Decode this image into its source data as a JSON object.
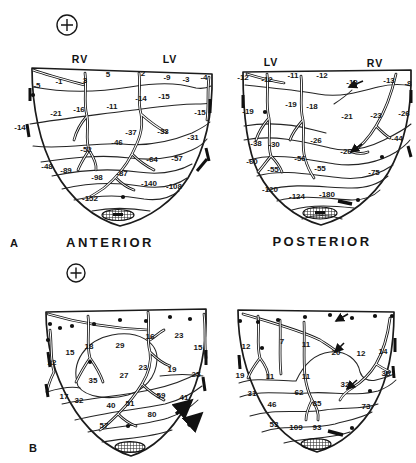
{
  "figure": {
    "panel_a_letter": "A",
    "panel_b_letter": "B",
    "anterior_title": "ANTERIOR",
    "posterior_title": "POSTERIOR",
    "orientation_symbol": "+",
    "ink_color": "#1b1b1b",
    "background_color": "#ffffff"
  },
  "maps": [
    {
      "id": "a-anterior",
      "region_labels": [
        {
          "t": "RV",
          "x": 80,
          "y": 63
        },
        {
          "t": "LV",
          "x": 170,
          "y": 63
        }
      ],
      "values": [
        {
          "t": "5",
          "x": 108,
          "y": 77
        },
        {
          "t": "2",
          "x": 143,
          "y": 76
        },
        {
          "t": "-9",
          "x": 167,
          "y": 80
        },
        {
          "t": "-3",
          "x": 186,
          "y": 82
        },
        {
          "t": "-4",
          "x": 204,
          "y": 80
        },
        {
          "t": "-1",
          "x": 59,
          "y": 84
        },
        {
          "t": "3",
          "x": 85,
          "y": 83
        },
        {
          "t": "-5",
          "x": 37,
          "y": 88
        },
        {
          "t": "-21",
          "x": 56,
          "y": 116
        },
        {
          "t": "-16",
          "x": 79,
          "y": 112
        },
        {
          "t": "-11",
          "x": 112,
          "y": 109
        },
        {
          "t": "-14",
          "x": 141,
          "y": 101
        },
        {
          "t": "-15",
          "x": 164,
          "y": 99
        },
        {
          "t": "-15",
          "x": 200,
          "y": 115
        },
        {
          "t": "-14",
          "x": 20,
          "y": 130
        },
        {
          "t": "-37",
          "x": 131,
          "y": 135
        },
        {
          "t": "-33",
          "x": 163,
          "y": 134
        },
        {
          "t": "-31",
          "x": 193,
          "y": 140
        },
        {
          "t": "-46",
          "x": 117,
          "y": 145
        },
        {
          "t": "-52",
          "x": 86,
          "y": 152
        },
        {
          "t": "-64",
          "x": 152,
          "y": 162
        },
        {
          "t": "-57",
          "x": 177,
          "y": 161
        },
        {
          "t": "-48",
          "x": 47,
          "y": 169
        },
        {
          "t": "-89",
          "x": 66,
          "y": 173
        },
        {
          "t": "-98",
          "x": 97,
          "y": 180
        },
        {
          "t": "-87",
          "x": 122,
          "y": 176
        },
        {
          "t": "-140",
          "x": 149,
          "y": 186
        },
        {
          "t": "-108",
          "x": 174,
          "y": 189
        },
        {
          "t": "-152",
          "x": 90,
          "y": 201
        }
      ],
      "dots": [
        [
          33,
          95
        ],
        [
          123,
          197
        ]
      ]
    },
    {
      "id": "a-posterior",
      "region_labels": [
        {
          "t": "LV",
          "x": 271,
          "y": 66
        },
        {
          "t": "RV",
          "x": 375,
          "y": 67
        }
      ],
      "values": [
        {
          "t": "-12",
          "x": 243,
          "y": 80
        },
        {
          "t": "-12",
          "x": 267,
          "y": 82
        },
        {
          "t": "-11",
          "x": 293,
          "y": 78
        },
        {
          "t": "-12",
          "x": 322,
          "y": 78
        },
        {
          "t": "-12",
          "x": 352,
          "y": 85
        },
        {
          "t": "-13",
          "x": 389,
          "y": 83
        },
        {
          "t": "-8",
          "x": 408,
          "y": 86
        },
        {
          "t": "-19",
          "x": 248,
          "y": 114
        },
        {
          "t": "-19",
          "x": 291,
          "y": 107
        },
        {
          "t": "-18",
          "x": 312,
          "y": 109
        },
        {
          "t": "-21",
          "x": 347,
          "y": 119
        },
        {
          "t": "-23",
          "x": 376,
          "y": 118
        },
        {
          "t": "-26",
          "x": 404,
          "y": 116
        },
        {
          "t": "-38",
          "x": 256,
          "y": 146
        },
        {
          "t": "-30",
          "x": 274,
          "y": 147
        },
        {
          "t": "-26",
          "x": 316,
          "y": 143
        },
        {
          "t": "-44",
          "x": 397,
          "y": 141
        },
        {
          "t": "-26",
          "x": 346,
          "y": 154
        },
        {
          "t": "-60",
          "x": 252,
          "y": 164
        },
        {
          "t": "-56",
          "x": 300,
          "y": 161
        },
        {
          "t": "-55",
          "x": 273,
          "y": 172
        },
        {
          "t": "-55",
          "x": 320,
          "y": 171
        },
        {
          "t": "-75",
          "x": 374,
          "y": 175
        },
        {
          "t": "-120",
          "x": 270,
          "y": 192
        },
        {
          "t": "-124",
          "x": 297,
          "y": 199
        },
        {
          "t": "-180",
          "x": 327,
          "y": 197
        }
      ],
      "dots": [
        [
          265,
          112
        ],
        [
          382,
          157
        ],
        [
          358,
          200
        ]
      ]
    },
    {
      "id": "b-anterior",
      "region_labels": [],
      "values": [
        {
          "t": "15",
          "x": 70,
          "y": 355
        },
        {
          "t": "18",
          "x": 89,
          "y": 349
        },
        {
          "t": "29",
          "x": 120,
          "y": 348
        },
        {
          "t": "16",
          "x": 150,
          "y": 339
        },
        {
          "t": "23",
          "x": 179,
          "y": 338
        },
        {
          "t": "15",
          "x": 198,
          "y": 350
        },
        {
          "t": "22",
          "x": 52,
          "y": 365
        },
        {
          "t": "23",
          "x": 143,
          "y": 370
        },
        {
          "t": "19",
          "x": 172,
          "y": 372
        },
        {
          "t": "25",
          "x": 196,
          "y": 377
        },
        {
          "t": "27",
          "x": 124,
          "y": 378
        },
        {
          "t": "35",
          "x": 93,
          "y": 383
        },
        {
          "t": "17",
          "x": 64,
          "y": 399
        },
        {
          "t": "32",
          "x": 79,
          "y": 403
        },
        {
          "t": "40",
          "x": 111,
          "y": 408
        },
        {
          "t": "51",
          "x": 130,
          "y": 406
        },
        {
          "t": "59",
          "x": 161,
          "y": 398
        },
        {
          "t": "41",
          "x": 184,
          "y": 400
        },
        {
          "t": "80",
          "x": 152,
          "y": 417
        },
        {
          "t": "57",
          "x": 104,
          "y": 428
        }
      ],
      "dots": [
        [
          50,
          324
        ],
        [
          60,
          328
        ],
        [
          72,
          326
        ],
        [
          94,
          324
        ],
        [
          120,
          320
        ],
        [
          146,
          321
        ],
        [
          170,
          317
        ],
        [
          190,
          319
        ],
        [
          48,
          340
        ],
        [
          90,
          362
        ],
        [
          128,
          426
        ]
      ]
    },
    {
      "id": "b-posterior",
      "region_labels": [],
      "values": [
        {
          "t": "12",
          "x": 246,
          "y": 349
        },
        {
          "t": "7",
          "x": 282,
          "y": 344
        },
        {
          "t": "11",
          "x": 306,
          "y": 347
        },
        {
          "t": "20",
          "x": 336,
          "y": 355
        },
        {
          "t": "12",
          "x": 361,
          "y": 356
        },
        {
          "t": "14",
          "x": 383,
          "y": 354
        },
        {
          "t": "19",
          "x": 240,
          "y": 378
        },
        {
          "t": "11",
          "x": 270,
          "y": 379
        },
        {
          "t": "11",
          "x": 306,
          "y": 379
        },
        {
          "t": "38",
          "x": 386,
          "y": 376
        },
        {
          "t": "32",
          "x": 345,
          "y": 387
        },
        {
          "t": "31",
          "x": 252,
          "y": 396
        },
        {
          "t": "62",
          "x": 299,
          "y": 395
        },
        {
          "t": "46",
          "x": 272,
          "y": 407
        },
        {
          "t": "85",
          "x": 317,
          "y": 406
        },
        {
          "t": "73",
          "x": 366,
          "y": 409
        },
        {
          "t": "53",
          "x": 274,
          "y": 427
        },
        {
          "t": "109",
          "x": 296,
          "y": 430
        },
        {
          "t": "93",
          "x": 317,
          "y": 430
        }
      ],
      "dots": [
        [
          240,
          321
        ],
        [
          258,
          322
        ],
        [
          278,
          320
        ],
        [
          305,
          317
        ],
        [
          330,
          315
        ],
        [
          352,
          318
        ],
        [
          375,
          316
        ],
        [
          392,
          316
        ],
        [
          262,
          348
        ],
        [
          370,
          391
        ],
        [
          352,
          428
        ]
      ]
    }
  ]
}
